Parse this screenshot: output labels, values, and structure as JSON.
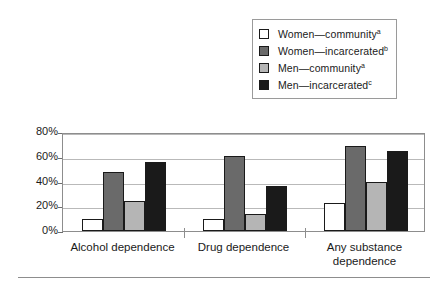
{
  "chart_data": {
    "type": "bar",
    "title": "",
    "xlabel": "",
    "ylabel": "Lifetime prevalence",
    "ylim": [
      0,
      80
    ],
    "grid": true,
    "legend_position": "top-right",
    "categories": [
      "Alcohol dependence",
      "Drug dependence",
      "Any substance\ndependence"
    ],
    "ytick_labels": [
      "0%",
      "20%",
      "40%",
      "60%",
      "80%"
    ],
    "ytick_values": [
      0,
      20,
      40,
      60,
      80
    ],
    "series": [
      {
        "name": "Women—community",
        "note": "a",
        "color": "#ffffff",
        "values": [
          10,
          10,
          23
        ]
      },
      {
        "name": "Women—incarcerated",
        "note": "b",
        "color": "#6a6a6a",
        "values": [
          48,
          61,
          69
        ]
      },
      {
        "name": "Men—community",
        "note": "a",
        "color": "#b5b5b5",
        "values": [
          24,
          14,
          40
        ]
      },
      {
        "name": "Men—incarcerated",
        "note": "c",
        "color": "#1a1a1a",
        "values": [
          56,
          36,
          65
        ]
      }
    ]
  },
  "legend": {
    "items": [
      {
        "label": "Women—community",
        "note": "a",
        "color": "#ffffff"
      },
      {
        "label": "Women—incarcerated",
        "note": "b",
        "color": "#6a6a6a"
      },
      {
        "label": "Men—community",
        "note": "a",
        "color": "#b5b5b5"
      },
      {
        "label": "Men—incarcerated",
        "note": "c",
        "color": "#1a1a1a"
      }
    ]
  }
}
